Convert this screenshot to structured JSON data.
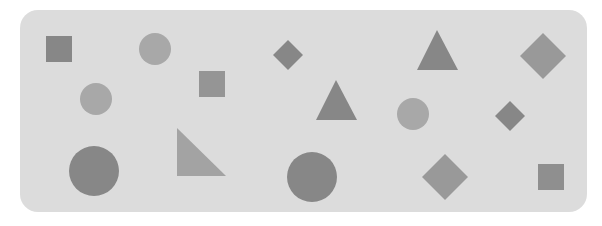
{
  "panel": {
    "background": "#dcdcdc",
    "x": 20,
    "y": 10,
    "width": 567,
    "height": 202,
    "radius": 18
  },
  "colors": {
    "dark": "#878787",
    "medium": "#959595",
    "light": "#a8a8a8"
  },
  "shapes": [
    {
      "id": "square-1",
      "type": "square",
      "x": 46,
      "y": 36,
      "size": 26,
      "color": "#878787"
    },
    {
      "id": "circle-1",
      "type": "circle",
      "cx": 155,
      "cy": 49,
      "r": 16,
      "color": "#a8a8a8"
    },
    {
      "id": "diamond-1",
      "type": "diamond",
      "cx": 288,
      "cy": 55,
      "half": 15,
      "color": "#878787"
    },
    {
      "id": "triangle-1",
      "type": "triangle",
      "points": "437,30 458,70 417,70",
      "color": "#878787"
    },
    {
      "id": "diamond-2",
      "type": "diamond",
      "cx": 543,
      "cy": 56,
      "half": 23,
      "color": "#999999"
    },
    {
      "id": "circle-2",
      "type": "circle",
      "cx": 96,
      "cy": 99,
      "r": 16,
      "color": "#a8a8a8"
    },
    {
      "id": "square-2",
      "type": "square",
      "x": 199,
      "y": 71,
      "size": 26,
      "color": "#959595"
    },
    {
      "id": "triangle-2",
      "type": "triangle",
      "points": "336,80 357,120 316,120",
      "color": "#878787"
    },
    {
      "id": "circle-3",
      "type": "circle",
      "cx": 413,
      "cy": 114,
      "r": 16,
      "color": "#a8a8a8"
    },
    {
      "id": "diamond-3",
      "type": "diamond",
      "cx": 510,
      "cy": 116,
      "half": 15,
      "color": "#878787"
    },
    {
      "id": "circle-4",
      "type": "circle",
      "cx": 94,
      "cy": 171,
      "r": 25,
      "color": "#878787"
    },
    {
      "id": "right-triangle-1",
      "type": "triangle",
      "points": "177,128 177,176 226,176",
      "color": "#a3a3a3"
    },
    {
      "id": "circle-5",
      "type": "circle",
      "cx": 312,
      "cy": 177,
      "r": 25,
      "color": "#878787"
    },
    {
      "id": "diamond-4",
      "type": "diamond",
      "cx": 445,
      "cy": 177,
      "half": 23,
      "color": "#999999"
    },
    {
      "id": "square-3",
      "type": "square",
      "x": 538,
      "y": 164,
      "size": 26,
      "color": "#8f8f8f"
    }
  ]
}
